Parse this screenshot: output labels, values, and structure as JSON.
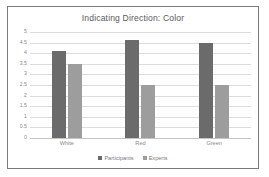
{
  "chart_data": {
    "type": "bar",
    "title": "Indicating Direction: Color",
    "xlabel": "",
    "ylabel": "",
    "categories": [
      "White",
      "Red",
      "Green"
    ],
    "series": [
      {
        "name": "Participants",
        "color": "#6b6b6b",
        "values": [
          4.1,
          4.6,
          4.5
        ]
      },
      {
        "name": "Experts",
        "color": "#9d9d9d",
        "values": [
          3.5,
          2.5,
          2.5
        ]
      }
    ],
    "ylim": [
      0,
      5
    ],
    "ytick_values": [
      0,
      0.5,
      1,
      1.5,
      2,
      2.5,
      3,
      3.5,
      4,
      4.5,
      5
    ],
    "ytick_labels": [
      "0",
      "0.5",
      "1",
      "1.5",
      "2",
      "2.5",
      "3",
      "3.5",
      "4",
      "4.5",
      "5"
    ],
    "grid": true,
    "legend_position": "bottom",
    "plot_background": "#ffffff",
    "gridline_color": "#dcdcdc",
    "border_color": "#7b7b7b"
  }
}
